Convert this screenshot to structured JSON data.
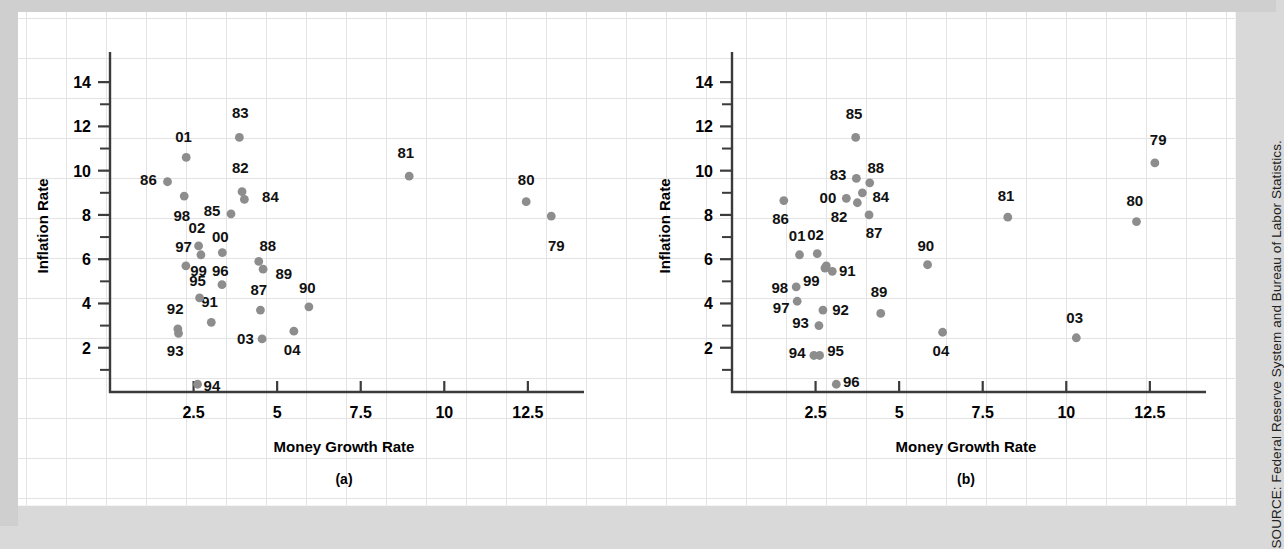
{
  "figure": {
    "source_note": "SOURCE: Federal Reserve System and Bureau of Labor Statistics.",
    "point_color": "#8d8d8d",
    "axis_color": "#3b3b3b"
  },
  "chart_data": [
    {
      "type": "scatter",
      "panel": "(a)",
      "title": "",
      "xlabel": "Money Growth Rate",
      "ylabel": "Inflation Rate",
      "xlim": [
        0,
        14
      ],
      "ylim": [
        0,
        15
      ],
      "xticks": [
        2.5,
        5,
        7.5,
        10,
        12.5
      ],
      "xticklabels": [
        "2.5",
        "5",
        "7.5",
        "10",
        "12.5"
      ],
      "yticks": [
        2,
        4,
        6,
        8,
        10,
        12,
        14
      ],
      "yticklabels": [
        "2",
        "4",
        "6",
        "8",
        "10",
        "12",
        "14"
      ],
      "yminorticks": [
        1,
        3,
        5,
        7,
        9,
        11,
        13
      ],
      "grid": false,
      "points": [
        {
          "label": "79",
          "x": 13.2,
          "y": 7.95,
          "lx": 13.35,
          "ly": 6.6,
          "anchor": "middle"
        },
        {
          "label": "80",
          "x": 12.45,
          "y": 8.6,
          "lx": 12.45,
          "ly": 9.6,
          "anchor": "middle"
        },
        {
          "label": "81",
          "x": 8.95,
          "y": 9.75,
          "lx": 8.85,
          "ly": 10.8,
          "anchor": "middle"
        },
        {
          "label": "82",
          "x": 3.95,
          "y": 9.05,
          "lx": 3.9,
          "ly": 10.1,
          "anchor": "middle"
        },
        {
          "label": "83",
          "x": 3.87,
          "y": 11.5,
          "lx": 3.9,
          "ly": 12.6,
          "anchor": "middle"
        },
        {
          "label": "84",
          "x": 4.02,
          "y": 8.7,
          "lx": 4.55,
          "ly": 8.8,
          "anchor": "start"
        },
        {
          "label": "85",
          "x": 3.62,
          "y": 8.05,
          "lx": 3.3,
          "ly": 8.2,
          "anchor": "end"
        },
        {
          "label": "86",
          "x": 1.72,
          "y": 9.5,
          "lx": 1.4,
          "ly": 9.6,
          "anchor": "end"
        },
        {
          "label": "87",
          "x": 4.5,
          "y": 3.7,
          "lx": 4.45,
          "ly": 4.6,
          "anchor": "middle"
        },
        {
          "label": "88",
          "x": 4.45,
          "y": 5.9,
          "lx": 4.72,
          "ly": 6.6,
          "anchor": "middle"
        },
        {
          "label": "89",
          "x": 4.58,
          "y": 5.55,
          "lx": 4.95,
          "ly": 5.35,
          "anchor": "start"
        },
        {
          "label": "90",
          "x": 5.95,
          "y": 3.85,
          "lx": 5.9,
          "ly": 4.7,
          "anchor": "middle"
        },
        {
          "label": "91",
          "x": 3.03,
          "y": 3.15,
          "lx": 2.98,
          "ly": 4.05,
          "anchor": "middle"
        },
        {
          "label": "92",
          "x": 2.03,
          "y": 2.85,
          "lx": 1.95,
          "ly": 3.75,
          "anchor": "middle"
        },
        {
          "label": "93",
          "x": 2.05,
          "y": 2.65,
          "lx": 1.95,
          "ly": 1.85,
          "anchor": "middle"
        },
        {
          "label": "94",
          "x": 2.62,
          "y": 0.35,
          "lx": 2.8,
          "ly": 0.25,
          "anchor": "start"
        },
        {
          "label": "95",
          "x": 2.68,
          "y": 4.25,
          "lx": 2.62,
          "ly": 5.0,
          "anchor": "middle"
        },
        {
          "label": "96",
          "x": 3.35,
          "y": 4.85,
          "lx": 3.3,
          "ly": 5.45,
          "anchor": "middle"
        },
        {
          "label": "97",
          "x": 2.27,
          "y": 5.7,
          "lx": 2.2,
          "ly": 6.55,
          "anchor": "middle"
        },
        {
          "label": "98",
          "x": 2.22,
          "y": 8.85,
          "lx": 2.15,
          "ly": 7.95,
          "anchor": "middle"
        },
        {
          "label": "99",
          "x": 2.72,
          "y": 6.2,
          "lx": 2.65,
          "ly": 5.45,
          "anchor": "middle"
        },
        {
          "label": "00",
          "x": 3.36,
          "y": 6.3,
          "lx": 3.3,
          "ly": 7.0,
          "anchor": "middle"
        },
        {
          "label": "01",
          "x": 2.28,
          "y": 10.6,
          "lx": 2.2,
          "ly": 11.5,
          "anchor": "middle"
        },
        {
          "label": "02",
          "x": 2.65,
          "y": 6.6,
          "lx": 2.6,
          "ly": 7.4,
          "anchor": "middle"
        },
        {
          "label": "03",
          "x": 4.55,
          "y": 2.4,
          "lx": 4.3,
          "ly": 2.4,
          "anchor": "end"
        },
        {
          "label": "04",
          "x": 5.5,
          "y": 2.75,
          "lx": 5.45,
          "ly": 1.9,
          "anchor": "middle"
        }
      ]
    },
    {
      "type": "scatter",
      "panel": "(b)",
      "title": "",
      "xlabel": "Money Growth Rate",
      "ylabel": "Inflation Rate",
      "xlim": [
        0,
        14
      ],
      "ylim": [
        0,
        15
      ],
      "xticks": [
        2.5,
        5,
        7.5,
        10,
        12.5
      ],
      "xticklabels": [
        "2.5",
        "5",
        "7.5",
        "10",
        "12.5"
      ],
      "yticks": [
        2,
        4,
        6,
        8,
        10,
        12,
        14
      ],
      "yticklabels": [
        "2",
        "4",
        "6",
        "8",
        "10",
        "12",
        "14"
      ],
      "yminorticks": [
        1,
        3,
        5,
        7,
        9,
        11,
        13
      ],
      "grid": false,
      "points": [
        {
          "label": "79",
          "x": 12.65,
          "y": 10.35,
          "lx": 12.75,
          "ly": 11.4,
          "anchor": "middle"
        },
        {
          "label": "80",
          "x": 12.1,
          "y": 7.7,
          "lx": 12.05,
          "ly": 8.65,
          "anchor": "middle"
        },
        {
          "label": "81",
          "x": 8.25,
          "y": 7.9,
          "lx": 8.2,
          "ly": 8.85,
          "anchor": "middle"
        },
        {
          "label": "82",
          "x": 3.75,
          "y": 8.55,
          "lx": 3.45,
          "ly": 7.9,
          "anchor": "end"
        },
        {
          "label": "83",
          "x": 3.72,
          "y": 9.65,
          "lx": 3.42,
          "ly": 9.8,
          "anchor": "end"
        },
        {
          "label": "84",
          "x": 3.9,
          "y": 9.0,
          "lx": 4.2,
          "ly": 8.8,
          "anchor": "start"
        },
        {
          "label": "85",
          "x": 3.7,
          "y": 11.5,
          "lx": 3.65,
          "ly": 12.55,
          "anchor": "middle"
        },
        {
          "label": "86",
          "x": 1.55,
          "y": 8.65,
          "lx": 1.45,
          "ly": 7.8,
          "anchor": "middle"
        },
        {
          "label": "87",
          "x": 4.1,
          "y": 8.0,
          "lx": 4.25,
          "ly": 7.2,
          "anchor": "middle"
        },
        {
          "label": "88",
          "x": 4.12,
          "y": 9.45,
          "lx": 4.3,
          "ly": 10.1,
          "anchor": "middle"
        },
        {
          "label": "89",
          "x": 4.45,
          "y": 3.55,
          "lx": 4.4,
          "ly": 4.5,
          "anchor": "middle"
        },
        {
          "label": "90",
          "x": 5.85,
          "y": 5.75,
          "lx": 5.8,
          "ly": 6.6,
          "anchor": "middle"
        },
        {
          "label": "91",
          "x": 3.0,
          "y": 5.45,
          "lx": 3.2,
          "ly": 5.45,
          "anchor": "start"
        },
        {
          "label": "92",
          "x": 2.78,
          "y": 5.6,
          "lx": 3.0,
          "ly": 3.7,
          "anchor": "start"
        },
        {
          "label": "93",
          "x": 2.6,
          "y": 3.0,
          "lx": 2.3,
          "ly": 3.1,
          "anchor": "end"
        },
        {
          "label": "94",
          "x": 2.45,
          "y": 1.65,
          "lx": 2.2,
          "ly": 1.75,
          "anchor": "end"
        },
        {
          "label": "95",
          "x": 2.62,
          "y": 1.65,
          "lx": 2.85,
          "ly": 1.85,
          "anchor": "start"
        },
        {
          "label": "96",
          "x": 3.12,
          "y": 0.35,
          "lx": 3.32,
          "ly": 0.45,
          "anchor": "start"
        },
        {
          "label": "97",
          "x": 1.95,
          "y": 4.1,
          "lx": 1.72,
          "ly": 3.8,
          "anchor": "end"
        },
        {
          "label": "98",
          "x": 1.92,
          "y": 4.75,
          "lx": 1.68,
          "ly": 4.7,
          "anchor": "end"
        },
        {
          "label": "99",
          "x": 2.82,
          "y": 5.7,
          "lx": 2.62,
          "ly": 5.0,
          "anchor": "end"
        },
        {
          "label": "00",
          "x": 3.42,
          "y": 8.75,
          "lx": 3.12,
          "ly": 8.75,
          "anchor": "end"
        },
        {
          "label": "01",
          "x": 2.02,
          "y": 6.2,
          "lx": 1.95,
          "ly": 7.05,
          "anchor": "middle"
        },
        {
          "label": "02",
          "x": 2.55,
          "y": 6.25,
          "lx": 2.5,
          "ly": 7.1,
          "anchor": "middle"
        },
        {
          "label": "03",
          "x": 10.3,
          "y": 2.45,
          "lx": 10.25,
          "ly": 3.35,
          "anchor": "middle"
        },
        {
          "label": "04",
          "x": 6.3,
          "y": 2.7,
          "lx": 6.25,
          "ly": 1.85,
          "anchor": "middle"
        },
        {
          "label": "92b",
          "x": 2.72,
          "y": 3.7,
          "lx": null,
          "ly": null,
          "anchor": "middle"
        }
      ]
    }
  ]
}
